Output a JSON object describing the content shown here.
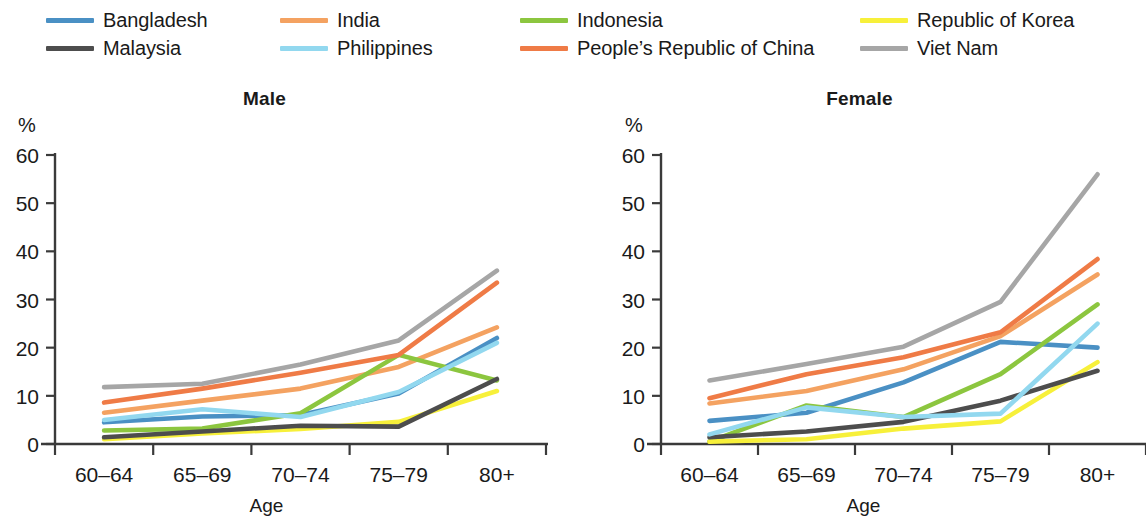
{
  "legend": {
    "rows": [
      [
        {
          "label": "Bangladesh",
          "color": "#4a90c4",
          "key": "bangladesh"
        },
        {
          "label": "India",
          "color": "#f4a261",
          "key": "india"
        },
        {
          "label": "Indonesia",
          "color": "#8cc63f",
          "key": "indonesia"
        },
        {
          "label": "Republic of Korea",
          "color": "#f7f03a",
          "key": "republic-of-korea"
        }
      ],
      [
        {
          "label": "Malaysia",
          "color": "#4d4d4d",
          "key": "malaysia"
        },
        {
          "label": "Philippines",
          "color": "#92d8ef",
          "key": "philippines"
        },
        {
          "label": "People’s Republic of China",
          "color": "#ef7b46",
          "key": "peoples-republic-of-china"
        },
        {
          "label": "Viet Nam",
          "color": "#a6a6a6",
          "key": "viet-nam"
        }
      ]
    ]
  },
  "panels": {
    "male": {
      "title": "Male",
      "unit": "%",
      "xlabel": "Age"
    },
    "female": {
      "title": "Female",
      "unit": "%",
      "xlabel": "Age"
    }
  },
  "chart_data": [
    {
      "type": "line",
      "title": "Male",
      "xlabel": "Age",
      "ylabel": "%",
      "ylim": [
        0,
        60
      ],
      "yticks": [
        0,
        10,
        20,
        30,
        40,
        50,
        60
      ],
      "grid": false,
      "legend_position": "top",
      "categories": [
        "60–64",
        "65–69",
        "70–74",
        "75–79",
        "80+"
      ],
      "series": [
        {
          "name": "Bangladesh",
          "color": "#4a90c4",
          "values": [
            4.5,
            5.7,
            6.0,
            10.5,
            22.0
          ]
        },
        {
          "name": "India",
          "color": "#f4a261",
          "values": [
            6.5,
            9.0,
            11.5,
            16.0,
            24.2
          ]
        },
        {
          "name": "Indonesia",
          "color": "#8cc63f",
          "values": [
            2.8,
            3.2,
            6.4,
            18.5,
            13.2
          ]
        },
        {
          "name": "Republic of Korea",
          "color": "#f7f03a",
          "values": [
            1.0,
            2.2,
            3.1,
            4.6,
            11.0
          ]
        },
        {
          "name": "Malaysia",
          "color": "#4d4d4d",
          "values": [
            1.4,
            2.6,
            3.8,
            3.6,
            13.5
          ]
        },
        {
          "name": "Philippines",
          "color": "#92d8ef",
          "values": [
            5.0,
            7.2,
            5.6,
            10.8,
            21.0
          ]
        },
        {
          "name": "People’s Republic of China",
          "color": "#ef7b46",
          "values": [
            8.6,
            11.5,
            14.8,
            18.5,
            33.5
          ]
        },
        {
          "name": "Viet Nam",
          "color": "#a6a6a6",
          "values": [
            11.8,
            12.5,
            16.5,
            21.5,
            36.0
          ]
        }
      ]
    },
    {
      "type": "line",
      "title": "Female",
      "xlabel": "Age",
      "ylabel": "%",
      "ylim": [
        0,
        60
      ],
      "yticks": [
        0,
        10,
        20,
        30,
        40,
        50,
        60
      ],
      "grid": false,
      "legend_position": "top",
      "categories": [
        "60–64",
        "65–69",
        "70–74",
        "75–79",
        "80+"
      ],
      "series": [
        {
          "name": "Bangladesh",
          "color": "#4a90c4",
          "values": [
            4.8,
            6.5,
            12.8,
            21.2,
            20.0
          ]
        },
        {
          "name": "India",
          "color": "#f4a261",
          "values": [
            8.4,
            11.0,
            15.5,
            22.4,
            35.2
          ]
        },
        {
          "name": "Indonesia",
          "color": "#8cc63f",
          "values": [
            0.5,
            8.0,
            5.6,
            14.5,
            29.0
          ]
        },
        {
          "name": "Republic of Korea",
          "color": "#f7f03a",
          "values": [
            0.5,
            1.0,
            3.2,
            4.7,
            17.0
          ]
        },
        {
          "name": "Malaysia",
          "color": "#4d4d4d",
          "values": [
            1.4,
            2.6,
            4.6,
            9.0,
            15.2
          ]
        },
        {
          "name": "Philippines",
          "color": "#92d8ef",
          "values": [
            2.0,
            7.6,
            5.6,
            6.3,
            25.0
          ]
        },
        {
          "name": "People’s Republic of China",
          "color": "#ef7b46",
          "values": [
            9.5,
            14.5,
            18.0,
            23.2,
            38.4
          ]
        },
        {
          "name": "Viet Nam",
          "color": "#a6a6a6",
          "values": [
            13.2,
            16.6,
            20.2,
            29.5,
            56.0
          ]
        }
      ]
    }
  ]
}
